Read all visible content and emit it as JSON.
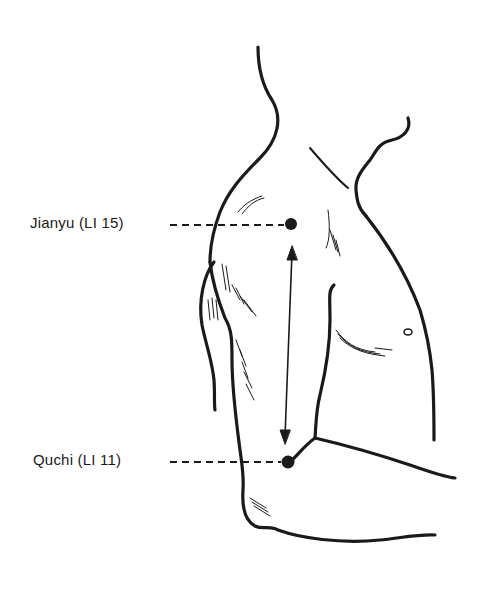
{
  "diagram": {
    "points": [
      {
        "id": "jianyu",
        "label": "Jianyu (LI 15)",
        "x": 291,
        "y": 224
      },
      {
        "id": "quchi",
        "label": "Quchi (LI 11)",
        "x": 288,
        "y": 462
      }
    ],
    "measurement_arrow": {
      "from": "jianyu",
      "to": "quchi",
      "style": "double-headed"
    },
    "colors": {
      "ink": "#1a1a1a",
      "background": "#ffffff"
    }
  }
}
